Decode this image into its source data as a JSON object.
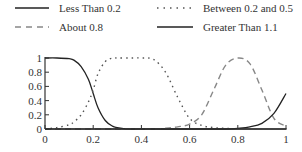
{
  "legend": [
    {
      "label": "Less Than 0.2",
      "style": "solid",
      "color": "#222222"
    },
    {
      "label": "Between 0.2 and 0.5",
      "style": "dotted",
      "color": "#555555"
    },
    {
      "label": "About 0.8",
      "style": "dashed",
      "color": "#888888"
    },
    {
      "label": "Greater Than 1.1",
      "style": "solid",
      "color": "#222222"
    }
  ],
  "chart_data": {
    "type": "line",
    "title": "",
    "xlabel": "",
    "ylabel": "",
    "xlim": [
      0,
      1
    ],
    "ylim": [
      0,
      1
    ],
    "x_ticks": [
      "0",
      "0.2",
      "0.4",
      "0.6",
      "0.8",
      "1"
    ],
    "y_ticks": [
      "0",
      "0.2",
      "0.4",
      "0.6",
      "0.8",
      "1"
    ],
    "grid": false,
    "legend_position": "top",
    "x": [
      0,
      0.05,
      0.1,
      0.12,
      0.15,
      0.18,
      0.2,
      0.22,
      0.25,
      0.28,
      0.3,
      0.35,
      0.4,
      0.45,
      0.5,
      0.55,
      0.6,
      0.65,
      0.7,
      0.75,
      0.8,
      0.85,
      0.9,
      0.95,
      1.0
    ],
    "series": [
      {
        "name": "Less Than 0.2",
        "style": "solid",
        "values": [
          1.0,
          1.0,
          0.99,
          0.97,
          0.88,
          0.7,
          0.5,
          0.3,
          0.12,
          0.04,
          0.02,
          0.0,
          0.0,
          0.0,
          0.0,
          0.0,
          0.0,
          0.0,
          0.0,
          0.0,
          0.0,
          0.0,
          0.0,
          0.0,
          0.0
        ]
      },
      {
        "name": "Between 0.2 and 0.5",
        "style": "dotted",
        "values": [
          0.0,
          0.02,
          0.06,
          0.1,
          0.2,
          0.38,
          0.55,
          0.78,
          0.95,
          1.0,
          1.0,
          1.0,
          1.0,
          0.98,
          0.8,
          0.45,
          0.15,
          0.05,
          0.02,
          0.01,
          0.0,
          0.0,
          0.0,
          0.0,
          0.0
        ]
      },
      {
        "name": "About 0.8",
        "style": "dashed",
        "values": [
          0.0,
          0.0,
          0.0,
          0.0,
          0.0,
          0.0,
          0.0,
          0.0,
          0.0,
          0.0,
          0.0,
          0.0,
          0.0,
          0.0,
          0.01,
          0.03,
          0.07,
          0.2,
          0.55,
          0.9,
          1.0,
          0.92,
          0.55,
          0.15,
          0.04
        ]
      },
      {
        "name": "Greater Than 1.1",
        "style": "solid",
        "values": [
          0.0,
          0.0,
          0.0,
          0.0,
          0.0,
          0.0,
          0.0,
          0.0,
          0.0,
          0.0,
          0.0,
          0.0,
          0.0,
          0.0,
          0.0,
          0.0,
          0.0,
          0.0,
          0.0,
          0.0,
          0.01,
          0.03,
          0.08,
          0.22,
          0.5
        ]
      }
    ]
  }
}
